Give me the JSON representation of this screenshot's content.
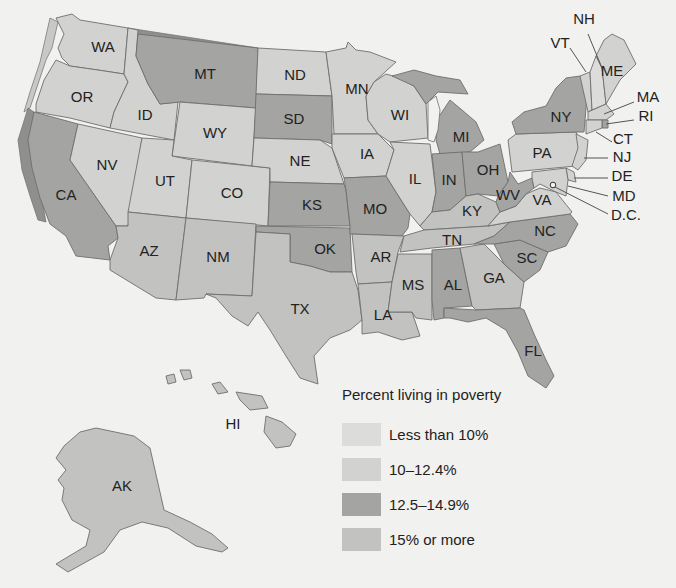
{
  "legend": {
    "title": "Percent living in poverty",
    "items": [
      {
        "key": "lt10",
        "label": "Less than 10%",
        "color": "#dcdcda"
      },
      {
        "key": "10to12",
        "label": "10–12.4%",
        "color": "#d2d2d0"
      },
      {
        "key": "12to15",
        "label": "12.5–14.9%",
        "color": "#a4a4a2"
      },
      {
        "key": "ge15",
        "label": "15% or more",
        "color": "#c2c2c0"
      }
    ]
  },
  "coast_band_color": "#8f8f8d",
  "states": {
    "WA": {
      "label": "WA",
      "category": "10to12"
    },
    "OR": {
      "label": "OR",
      "category": "10to12"
    },
    "CA": {
      "label": "CA",
      "category": "12to15"
    },
    "ID": {
      "label": "ID",
      "category": "10to12"
    },
    "NV": {
      "label": "NV",
      "category": "10to12"
    },
    "MT": {
      "label": "MT",
      "category": "12to15"
    },
    "WY": {
      "label": "WY",
      "category": "10to12"
    },
    "UT": {
      "label": "UT",
      "category": "10to12"
    },
    "CO": {
      "label": "CO",
      "category": "10to12"
    },
    "AZ": {
      "label": "AZ",
      "category": "ge15"
    },
    "NM": {
      "label": "NM",
      "category": "ge15"
    },
    "ND": {
      "label": "ND",
      "category": "10to12"
    },
    "SD": {
      "label": "SD",
      "category": "12to15"
    },
    "NE": {
      "label": "NE",
      "category": "10to12"
    },
    "KS": {
      "label": "KS",
      "category": "12to15"
    },
    "OK": {
      "label": "OK",
      "category": "12to15"
    },
    "TX": {
      "label": "TX",
      "category": "ge15"
    },
    "MN": {
      "label": "MN",
      "category": "10to12"
    },
    "IA": {
      "label": "IA",
      "category": "10to12"
    },
    "MO": {
      "label": "MO",
      "category": "12to15"
    },
    "AR": {
      "label": "AR",
      "category": "ge15"
    },
    "LA": {
      "label": "LA",
      "category": "ge15"
    },
    "WI": {
      "label": "WI",
      "category": "10to12"
    },
    "IL": {
      "label": "IL",
      "category": "10to12"
    },
    "MS": {
      "label": "MS",
      "category": "ge15"
    },
    "MI": {
      "label": "MI",
      "category": "12to15"
    },
    "IN": {
      "label": "IN",
      "category": "12to15"
    },
    "OH": {
      "label": "OH",
      "category": "12to15"
    },
    "KY": {
      "label": "KY",
      "category": "ge15"
    },
    "TN": {
      "label": "TN",
      "category": "ge15"
    },
    "AL": {
      "label": "AL",
      "category": "12to15"
    },
    "GA": {
      "label": "GA",
      "category": "ge15"
    },
    "FL": {
      "label": "FL",
      "category": "12to15"
    },
    "SC": {
      "label": "SC",
      "category": "12to15"
    },
    "NC": {
      "label": "NC",
      "category": "12to15"
    },
    "VA": {
      "label": "VA",
      "category": "10to12"
    },
    "WV": {
      "label": "WV",
      "category": "12to15"
    },
    "PA": {
      "label": "PA",
      "category": "10to12"
    },
    "NY": {
      "label": "NY",
      "category": "12to15"
    },
    "VT": {
      "label": "VT",
      "category": "10to12"
    },
    "NH": {
      "label": "NH",
      "category": "lt10"
    },
    "ME": {
      "label": "ME",
      "category": "10to12"
    },
    "MA": {
      "label": "MA",
      "category": "10to12"
    },
    "RI": {
      "label": "RI",
      "category": "12to15"
    },
    "CT": {
      "label": "CT",
      "category": "10to12"
    },
    "NJ": {
      "label": "NJ",
      "category": "10to12"
    },
    "DE": {
      "label": "DE",
      "category": "10to12"
    },
    "MD": {
      "label": "MD",
      "category": "10to12"
    },
    "DC": {
      "label": "D.C.",
      "category": "12to15"
    },
    "AK": {
      "label": "AK",
      "category": "ge15"
    },
    "HI": {
      "label": "HI",
      "category": "ge15"
    }
  }
}
